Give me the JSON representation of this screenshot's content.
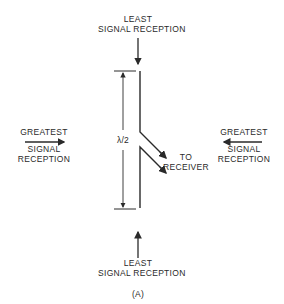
{
  "diagram": {
    "type": "half-wave dipole reception pattern",
    "top_label": {
      "line1": "LEAST",
      "line2": "SIGNAL RECEPTION"
    },
    "bottom_label": {
      "line1": "LEAST",
      "line2": "SIGNAL RECEPTION"
    },
    "left_label": {
      "line1": "GREATEST",
      "line2": "SIGNAL",
      "line3": "RECEPTION"
    },
    "right_label": {
      "line1": "GREATEST",
      "line2": "SIGNAL",
      "line3": "RECEPTION"
    },
    "dimension_label": "λ/2",
    "feed_label": {
      "line1": "TO",
      "line2": "RECEIVER"
    },
    "caption": "(A)",
    "line_color": "#2a2a2a"
  }
}
